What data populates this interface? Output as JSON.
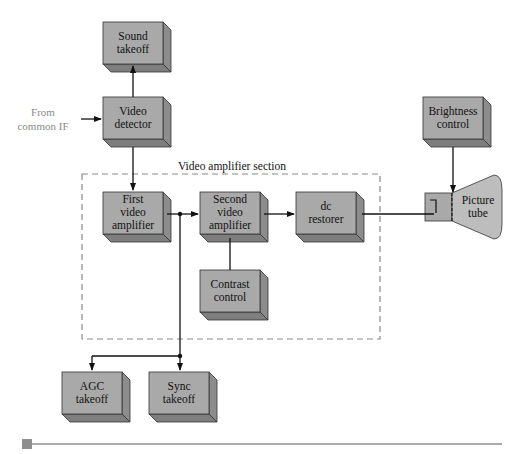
{
  "diagram": {
    "input_label": "From\ncommon IF",
    "section_label": "Video amplifier section",
    "blocks": [
      {
        "id": "sound-takeoff",
        "label": "Sound\ntakeoff",
        "x": 103,
        "y": 22,
        "w": 60,
        "h": 42
      },
      {
        "id": "video-detector",
        "label": "Video\ndetector",
        "x": 103,
        "y": 97,
        "w": 60,
        "h": 42
      },
      {
        "id": "first-video-amplifier",
        "label": "First\nvideo\namplifier",
        "x": 103,
        "y": 192,
        "w": 60,
        "h": 42
      },
      {
        "id": "second-video-amplifier",
        "label": "Second\nvideo\namplifier",
        "x": 200,
        "y": 192,
        "w": 60,
        "h": 42
      },
      {
        "id": "dc-restorer",
        "label": "dc\nrestorer",
        "x": 296,
        "y": 192,
        "w": 60,
        "h": 42
      },
      {
        "id": "contrast-control",
        "label": "Contrast\ncontrol",
        "x": 200,
        "y": 270,
        "w": 60,
        "h": 42
      },
      {
        "id": "brightness-control",
        "label": "Brightness\ncontrol",
        "x": 423,
        "y": 97,
        "w": 60,
        "h": 42
      },
      {
        "id": "agc-takeoff",
        "label": "AGC\ntakeoff",
        "x": 62,
        "y": 372,
        "w": 60,
        "h": 42
      },
      {
        "id": "sync-takeoff",
        "label": "Sync\ntakeoff",
        "x": 149,
        "y": 372,
        "w": 60,
        "h": 42
      }
    ],
    "picture_tube": {
      "label": "Picture\ntube"
    },
    "colors": {
      "block_face": "#a9a9a9",
      "block_top": "#bdbdbd",
      "block_side": "#8c8c8c",
      "line": "#111111",
      "dash": "#8a8a8a",
      "rule": "#8e8e8e"
    }
  }
}
